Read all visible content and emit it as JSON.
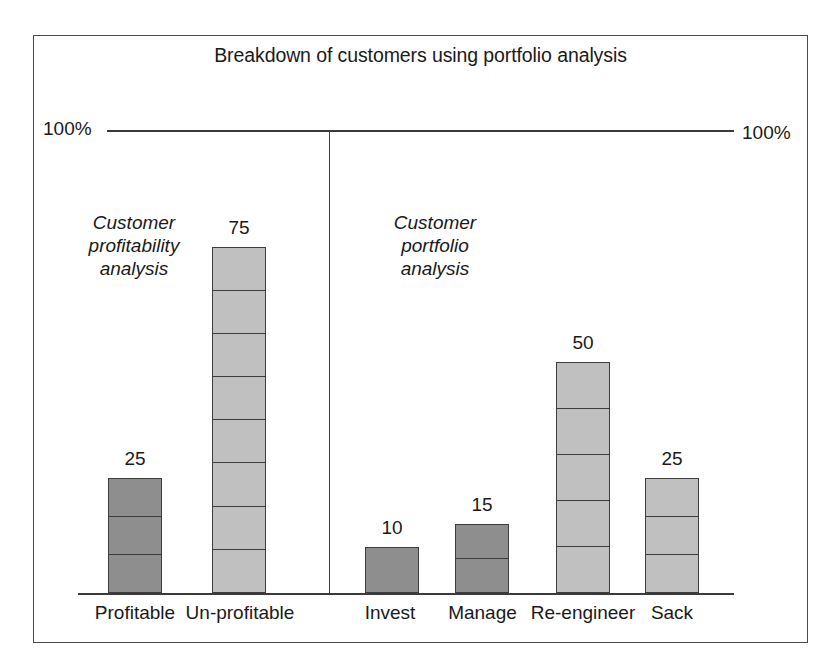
{
  "chart_data": {
    "type": "bar",
    "title": "Breakdown of customers using portfolio analysis",
    "xlabel": "",
    "ylabel": "",
    "ylim": [
      0,
      100
    ],
    "grid": false,
    "legend": "none",
    "axis_reference_labels": {
      "left": "100%",
      "right": "100%"
    },
    "panels": [
      {
        "caption": "Customer\nprofitability\nanalysis",
        "categories": [
          "Profitable",
          "Un-profitable"
        ],
        "values": [
          25,
          75
        ]
      },
      {
        "caption": "Customer\nportfolio\nanalysis",
        "categories": [
          "Invest",
          "Manage",
          "Re-engineer",
          "Sack"
        ],
        "values": [
          10,
          15,
          50,
          25
        ]
      }
    ],
    "categories": [
      "Profitable",
      "Un-profitable",
      "Invest",
      "Manage",
      "Re-engineer",
      "Sack"
    ],
    "values": [
      25,
      75,
      10,
      15,
      50,
      25
    ],
    "bars": [
      {
        "label": "Profitable",
        "value": 25,
        "value_text": "25",
        "shade": "dark",
        "segments": 3
      },
      {
        "label": "Un-profitable",
        "value": 75,
        "value_text": "75",
        "shade": "light",
        "segments": 8
      },
      {
        "label": "Invest",
        "value": 10,
        "value_text": "10",
        "shade": "dark",
        "segments": 1
      },
      {
        "label": "Manage",
        "value": 15,
        "value_text": "15",
        "shade": "dark",
        "segments": 2
      },
      {
        "label": "Re-engineer",
        "value": 50,
        "value_text": "50",
        "shade": "light",
        "segments": 5
      },
      {
        "label": "Sack",
        "value": 25,
        "value_text": "25",
        "shade": "light",
        "segments": 3
      }
    ],
    "colors": {
      "dark_bar": "#8e8e8e",
      "light_bar": "#c0c0c0",
      "outline": "#3d3d3d",
      "frame": "#4a4a4a",
      "background": "#ffffff",
      "text": "#1a1a1a"
    }
  }
}
